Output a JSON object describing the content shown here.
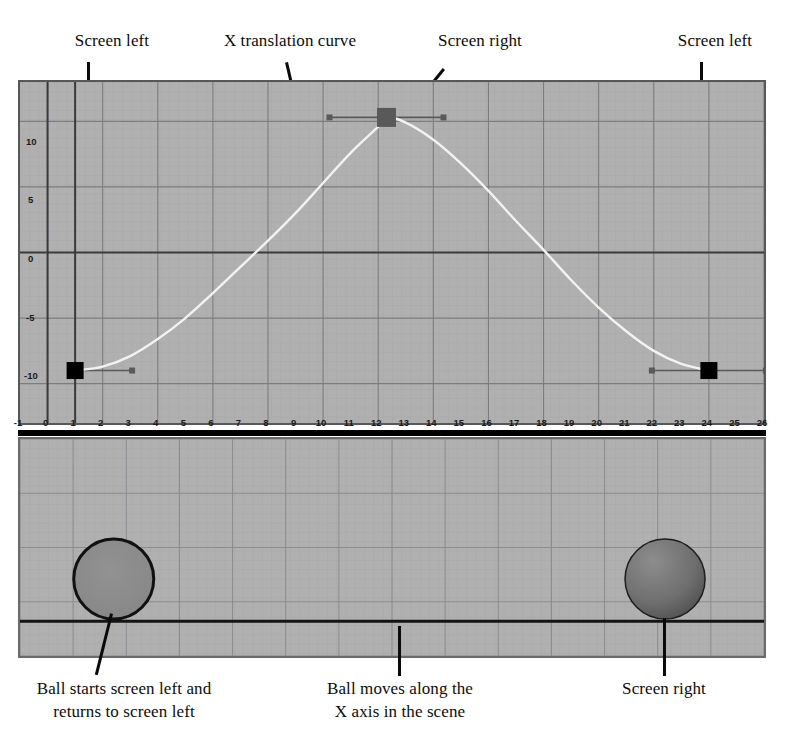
{
  "figure": {
    "title_annotations_top": [
      {
        "id": "screen-left-1",
        "text": "Screen left"
      },
      {
        "id": "x-translation-curve",
        "text": "X translation curve"
      },
      {
        "id": "screen-right-top",
        "text": "Screen right"
      },
      {
        "id": "screen-left-2",
        "text": "Screen left"
      }
    ],
    "bottom_annotations": [
      {
        "id": "ball-starts",
        "line1": "Ball starts screen left and",
        "line2": "returns to screen left"
      },
      {
        "id": "ball-moves",
        "line1": "Ball moves along the",
        "line2": "X axis in the scene"
      },
      {
        "id": "screen-right-bottom",
        "line1": "Screen right",
        "line2": ""
      }
    ],
    "colors": {
      "panel_background": "#b0b0b0",
      "grid_minor": "#9a9a9a",
      "grid_major": "#777779",
      "axis_line": "#3a3a3c",
      "curve": "#f2f2f2",
      "keyframe_unselected": "#000000",
      "keyframe_selected": "#595959",
      "tangent_handle": "#5a5a5c",
      "leader_line": "#0a0a0a",
      "ball_left": "#8a8a8a",
      "ball_right": "#6f6f6f",
      "ball_outline": "#111111",
      "ground_line": "#141414"
    }
  },
  "chart_data": {
    "type": "line",
    "title": "X translation curve",
    "xlabel": "",
    "ylabel": "",
    "xlim": [
      -1,
      26
    ],
    "ylim": [
      -13,
      13
    ],
    "grid": true,
    "legend": false,
    "xticks": [
      -1,
      0,
      1,
      2,
      3,
      4,
      5,
      6,
      7,
      8,
      9,
      10,
      11,
      12,
      13,
      14,
      15,
      16,
      17,
      18,
      19,
      20,
      21,
      22,
      23,
      24,
      25,
      26
    ],
    "xtick_labels": [
      "-1",
      "0",
      "1",
      "2",
      "3",
      "4",
      "5",
      "6",
      "7",
      "8",
      "9",
      "10",
      "11",
      "12",
      "13",
      "14",
      "15",
      "16",
      "17",
      "18",
      "19",
      "20",
      "21",
      "22",
      "23",
      "24",
      "25",
      "26"
    ],
    "yticks": [
      10,
      5,
      0,
      -5,
      -10
    ],
    "ytick_labels": [
      "10",
      "5",
      "0",
      "-5",
      "-10"
    ],
    "series": [
      {
        "name": "X translation",
        "type": "bezier",
        "keyframes": [
          {
            "frame": 1,
            "value": -9,
            "selected": false,
            "tangent": "flat",
            "handle_left": false,
            "handle_right": true
          },
          {
            "frame": 12.3,
            "value": 10.3,
            "selected": true,
            "tangent": "flat",
            "handle_left": true,
            "handle_right": true
          },
          {
            "frame": 24,
            "value": -9,
            "selected": false,
            "tangent": "flat",
            "handle_left": true,
            "handle_right": true
          }
        ],
        "sampled_points": [
          {
            "x": 1,
            "y": -9
          },
          {
            "x": 2,
            "y": -8.7
          },
          {
            "x": 3,
            "y": -7.9
          },
          {
            "x": 4,
            "y": -6.6
          },
          {
            "x": 5,
            "y": -5.0
          },
          {
            "x": 6,
            "y": -3.1
          },
          {
            "x": 7,
            "y": -1.1
          },
          {
            "x": 8,
            "y": 0.9
          },
          {
            "x": 9,
            "y": 3.0
          },
          {
            "x": 10,
            "y": 5.3
          },
          {
            "x": 11,
            "y": 7.6
          },
          {
            "x": 12,
            "y": 9.6
          },
          {
            "x": 12.3,
            "y": 10.3
          },
          {
            "x": 13,
            "y": 9.9
          },
          {
            "x": 14,
            "y": 8.6
          },
          {
            "x": 15,
            "y": 6.8
          },
          {
            "x": 16,
            "y": 4.7
          },
          {
            "x": 17,
            "y": 2.4
          },
          {
            "x": 18,
            "y": 0.2
          },
          {
            "x": 19,
            "y": -2.1
          },
          {
            "x": 20,
            "y": -4.2
          },
          {
            "x": 21,
            "y": -6.0
          },
          {
            "x": 22,
            "y": -7.5
          },
          {
            "x": 23,
            "y": -8.5
          },
          {
            "x": 24,
            "y": -9
          }
        ]
      }
    ]
  },
  "scene": {
    "balls": [
      {
        "id": "ball-left",
        "position": "screen left",
        "cx_frac": 0.126,
        "cy_frac": 0.645,
        "r": 40,
        "fill": "#8a8a8a",
        "shaded": false
      },
      {
        "id": "ball-right",
        "position": "screen right",
        "cx_frac": 0.867,
        "cy_frac": 0.645,
        "r": 40,
        "fill": "#6f6f6f",
        "shaded": true
      }
    ],
    "ground_line_y_frac": 0.84
  }
}
